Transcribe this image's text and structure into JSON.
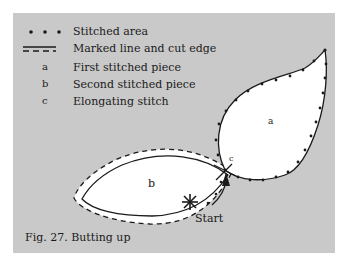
{
  "legend": {
    "items": [
      {
        "key": "dots",
        "symbol": "• • •",
        "label": "Stitched area"
      },
      {
        "key": "dashes",
        "symbol": "- - -",
        "label": "Marked line and cut edge"
      },
      {
        "key": "a",
        "symbol": "a",
        "label": "First stitched piece"
      },
      {
        "key": "b",
        "symbol": "b",
        "label": "Second stitched piece"
      },
      {
        "key": "c",
        "symbol": "c",
        "label": "Elongating stitch"
      }
    ]
  },
  "diagram": {
    "piece_a_label": "a",
    "piece_b_label": "b",
    "junction_label": "c",
    "start_label": "Start"
  },
  "caption": "Fig. 27. Butting up",
  "colors": {
    "background": "#c9c9c9",
    "piece_fill": "#ffffff",
    "ink": "#1a1a1a"
  }
}
